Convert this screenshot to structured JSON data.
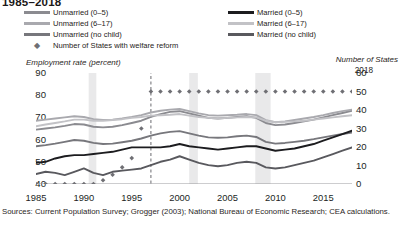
{
  "title": "1985–2018",
  "legend": {
    "items": [
      {
        "label": "Unmarried (0–5)",
        "color": "#8b8b90",
        "type": "line",
        "col": 0,
        "row": 0
      },
      {
        "label": "Unmarried (6–17)",
        "color": "#a9a9ae",
        "type": "line",
        "col": 0,
        "row": 1
      },
      {
        "label": "Unmarried (no child)",
        "color": "#77777c",
        "type": "line",
        "col": 0,
        "row": 2
      },
      {
        "label": "Married (0–5)",
        "color": "#1c1c1f",
        "type": "line",
        "col": 1,
        "row": 0
      },
      {
        "label": "Married (6–17)",
        "color": "#c2c2c6",
        "type": "line",
        "col": 1,
        "row": 1
      },
      {
        "label": "Married (no child)",
        "color": "#59595e",
        "type": "line",
        "col": 1,
        "row": 2
      },
      {
        "label": "Number of States with welfare reform",
        "color": "#6f6f74",
        "type": "diamond",
        "col": 0,
        "row": 3
      }
    ]
  },
  "annotations": {
    "end_year_label": "2018",
    "reform_line_year": 1997
  },
  "sources": "Sources: Current Population Survey; Grogger (2003); National Bureau of Economic Research; CEA calculations.",
  "chart_data": {
    "type": "line",
    "title": "1985–2018",
    "xlabel": "",
    "ylabel": "Employment rate (percent)",
    "ylabel_right": "Number of States",
    "xlim": [
      1985,
      2018
    ],
    "ylim": [
      40,
      90
    ],
    "ylim_right": [
      0,
      60
    ],
    "xticks": [
      1985,
      1990,
      1995,
      2000,
      2005,
      2010,
      2015
    ],
    "yticks": [
      40,
      50,
      60,
      70,
      80,
      90
    ],
    "yticks_right": [
      0,
      10,
      20,
      30,
      40,
      50,
      60
    ],
    "grid": false,
    "legend_position": "top",
    "x": [
      1985,
      1986,
      1987,
      1988,
      1989,
      1990,
      1991,
      1992,
      1993,
      1994,
      1995,
      1996,
      1997,
      1998,
      1999,
      2000,
      2001,
      2002,
      2003,
      2004,
      2005,
      2006,
      2007,
      2008,
      2009,
      2010,
      2011,
      2012,
      2013,
      2014,
      2015,
      2016,
      2017,
      2018
    ],
    "series": [
      {
        "name": "Unmarried (0–5)",
        "color": "#8b8b90",
        "axis": "left",
        "values": [
          64.5,
          65.0,
          65.5,
          66.2,
          67.0,
          66.8,
          65.8,
          65.5,
          65.8,
          66.5,
          67.5,
          68.5,
          70.2,
          71.5,
          72.5,
          72.8,
          71.8,
          70.8,
          69.8,
          69.5,
          69.8,
          70.2,
          70.5,
          69.8,
          67.5,
          66.5,
          66.8,
          67.5,
          68.2,
          69.0,
          70.0,
          71.0,
          72.0,
          73.0
        ]
      },
      {
        "name": "Unmarried (6–17)",
        "color": "#a9a9ae",
        "axis": "left",
        "values": [
          68.5,
          69.0,
          69.5,
          70.0,
          70.5,
          70.2,
          69.2,
          68.8,
          69.0,
          69.5,
          70.2,
          71.0,
          72.2,
          73.0,
          73.5,
          73.8,
          72.8,
          71.8,
          71.0,
          70.8,
          71.0,
          71.2,
          71.5,
          71.0,
          68.8,
          67.8,
          68.2,
          68.8,
          69.5,
          70.2,
          71.0,
          72.0,
          72.8,
          73.5
        ]
      },
      {
        "name": "Unmarried (no child)",
        "color": "#77777c",
        "axis": "left",
        "values": [
          57.0,
          57.5,
          58.2,
          59.0,
          59.8,
          59.5,
          58.5,
          58.0,
          58.2,
          58.8,
          59.5,
          60.5,
          61.8,
          62.8,
          63.5,
          63.8,
          62.8,
          61.8,
          61.0,
          60.8,
          61.0,
          61.5,
          61.8,
          61.2,
          59.0,
          58.2,
          58.5,
          59.0,
          59.5,
          60.2,
          61.0,
          61.8,
          62.5,
          63.2
        ]
      },
      {
        "name": "Married (0–5)",
        "color": "#1c1c1f",
        "axis": "left",
        "values": [
          49.5,
          50.0,
          51.5,
          52.5,
          53.0,
          53.0,
          53.5,
          54.0,
          54.5,
          55.5,
          56.5,
          56.5,
          56.5,
          56.5,
          57.0,
          58.0,
          57.0,
          56.5,
          56.0,
          55.5,
          56.0,
          56.5,
          57.0,
          57.0,
          56.0,
          55.0,
          55.5,
          56.0,
          57.0,
          58.0,
          59.5,
          61.0,
          62.5,
          64.0
        ]
      },
      {
        "name": "Married (6–17)",
        "color": "#c2c2c6",
        "axis": "left",
        "values": [
          66.0,
          66.8,
          67.5,
          68.2,
          69.0,
          69.0,
          68.5,
          68.5,
          68.8,
          69.2,
          69.8,
          70.2,
          70.8,
          71.0,
          71.2,
          71.5,
          70.8,
          70.2,
          69.8,
          69.5,
          69.8,
          70.0,
          70.2,
          70.0,
          68.5,
          67.8,
          68.0,
          68.2,
          68.5,
          69.0,
          69.5,
          70.0,
          70.5,
          71.0
        ]
      },
      {
        "name": "Married (no child)",
        "color": "#59595e",
        "axis": "left",
        "values": [
          44.5,
          45.5,
          45.0,
          44.0,
          45.5,
          47.0,
          45.0,
          44.0,
          45.5,
          46.0,
          46.5,
          47.0,
          48.5,
          50.0,
          51.0,
          52.5,
          51.0,
          49.5,
          48.5,
          48.0,
          48.5,
          49.5,
          50.0,
          49.5,
          47.5,
          47.0,
          47.5,
          48.5,
          49.5,
          50.5,
          52.0,
          53.5,
          55.0,
          56.5
        ]
      }
    ],
    "diamond_series": {
      "name": "Number of States with welfare reform",
      "color": "#6f6f74",
      "axis": "right",
      "marker": "diamond",
      "values": [
        0,
        0,
        0,
        0,
        0,
        0,
        0,
        2,
        5,
        9,
        14,
        30,
        50,
        50,
        50,
        50,
        50,
        50,
        50,
        50,
        50,
        50,
        50,
        50,
        50,
        50,
        50,
        50,
        50,
        50,
        50,
        50,
        50,
        50
      ]
    },
    "recession_bands": [
      {
        "start": 1990.5,
        "end": 1991.3
      },
      {
        "start": 2001.0,
        "end": 2001.9
      },
      {
        "start": 2007.9,
        "end": 2009.5
      }
    ],
    "vlines": [
      {
        "x": 1997,
        "style": "dashed",
        "color": "#6b6b70"
      }
    ]
  }
}
